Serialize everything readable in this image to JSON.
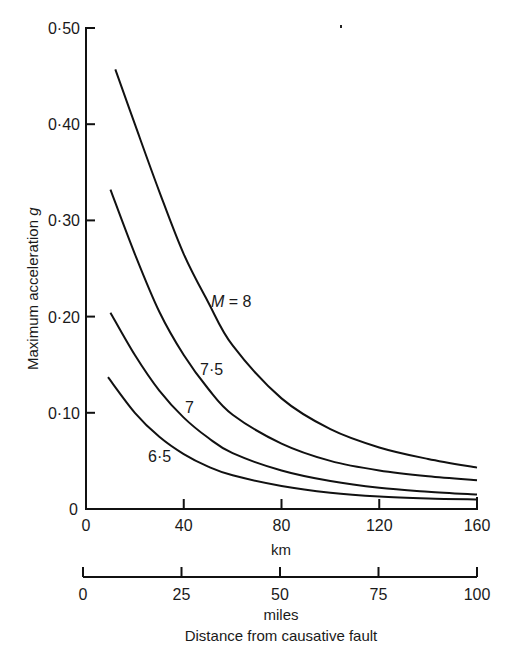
{
  "chart_data": {
    "type": "line",
    "title": "",
    "xlabel": "Distance from causative fault",
    "ylabel": "Maximum acceleration g",
    "x_unit_primary": "km",
    "x_unit_secondary": "miles",
    "xlim": [
      0,
      160
    ],
    "ylim": [
      0,
      0.5
    ],
    "x_ticks_km": [
      "0",
      "40",
      "80",
      "120",
      "160"
    ],
    "x_ticks_miles": [
      "0",
      "25",
      "50",
      "75",
      "100"
    ],
    "y_ticks": [
      "0",
      "0·10",
      "0·20",
      "0·30",
      "0·40",
      "0·50"
    ],
    "grid": false,
    "legend": "inline curve labels",
    "series": [
      {
        "name": "M = 8",
        "label": "M = 8",
        "x": [
          12,
          20,
          30,
          40,
          50,
          60,
          80,
          100,
          120,
          140,
          160
        ],
        "values": [
          0.457,
          0.4,
          0.33,
          0.265,
          0.215,
          0.17,
          0.115,
          0.083,
          0.064,
          0.052,
          0.043
        ]
      },
      {
        "name": "M = 7.5",
        "label": "7·5",
        "x": [
          10,
          20,
          30,
          40,
          50,
          60,
          80,
          100,
          120,
          140,
          160
        ],
        "values": [
          0.332,
          0.265,
          0.205,
          0.16,
          0.125,
          0.098,
          0.068,
          0.05,
          0.04,
          0.034,
          0.03
        ]
      },
      {
        "name": "M = 7",
        "label": "7",
        "x": [
          10,
          20,
          30,
          40,
          50,
          60,
          80,
          100,
          120,
          140,
          160
        ],
        "values": [
          0.204,
          0.16,
          0.123,
          0.095,
          0.074,
          0.058,
          0.04,
          0.029,
          0.022,
          0.018,
          0.015
        ]
      },
      {
        "name": "M = 6.5",
        "label": "6·5",
        "x": [
          9,
          20,
          30,
          40,
          50,
          60,
          80,
          100,
          120,
          140,
          160
        ],
        "values": [
          0.137,
          0.1,
          0.075,
          0.057,
          0.044,
          0.035,
          0.024,
          0.017,
          0.013,
          0.011,
          0.01
        ]
      }
    ]
  },
  "labels": {
    "ylabel": "Maximum acceleration g",
    "ylabel_main": "Maximum acceleration ",
    "ylabel_var": "g",
    "km": "km",
    "miles": "miles",
    "xlabel": "Distance from causative fault",
    "m8_prefix": "M",
    "m8_suffix": " = 8",
    "m75": "7·5",
    "m7": "7",
    "m65": "6·5",
    "origin_y": "0",
    "origin_x": "0"
  }
}
